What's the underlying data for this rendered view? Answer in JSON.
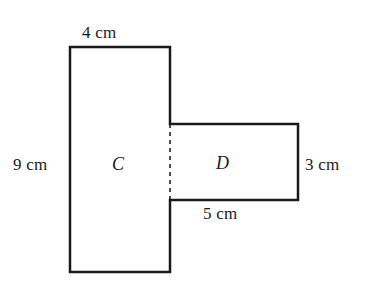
{
  "figure": {
    "kind": "composite-rectangle-diagram",
    "background_color": "#ffffff",
    "stroke_color": "#1a1a1a",
    "stroke_width_px": 2.5,
    "dashed_stroke_width_px": 1.6,
    "dash_pattern": "4,4",
    "unit": "cm",
    "regions": [
      {
        "id": "C",
        "label": "C",
        "shape": "rectangle",
        "width_cm": 4,
        "height_cm": 9,
        "x_px": 70,
        "y_px": 47,
        "w_px": 100,
        "h_px": 225
      },
      {
        "id": "D",
        "label": "D",
        "shape": "rectangle",
        "width_cm": 5,
        "height_cm": 3,
        "x_px": 170,
        "y_px": 124,
        "w_px": 128,
        "h_px": 76
      }
    ],
    "dimension_labels": [
      {
        "id": "top",
        "text": "4 cm",
        "edge": "top-of-C",
        "position": "above"
      },
      {
        "id": "left",
        "text": "9 cm",
        "edge": "left-of-C",
        "position": "left"
      },
      {
        "id": "right",
        "text": "3 cm",
        "edge": "right-of-D",
        "position": "right"
      },
      {
        "id": "bottom",
        "text": "5 cm",
        "edge": "bottom-of-D",
        "position": "below"
      }
    ],
    "shared_boundary": {
      "style": "dashed",
      "x_px": 170,
      "y1_px": 124,
      "y2_px": 200
    },
    "outline_path": "M 70 47 L 170 47 L 170 124 L 298 124 L 298 200 L 170 200 L 170 272 L 70 272 Z"
  }
}
